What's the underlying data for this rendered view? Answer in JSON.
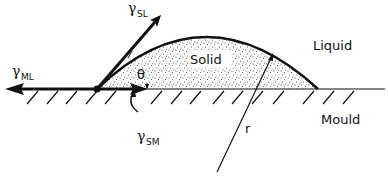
{
  "figure": {
    "type": "contact-angle-diagram",
    "labels": {
      "solid": "Solid",
      "liquid": "Liquid",
      "mould": "Mould",
      "theta": "θ",
      "radius": "r"
    },
    "tensions": {
      "sl": {
        "symbol": "γ",
        "subscript": "SL",
        "direction": "up-right along tangent"
      },
      "ml": {
        "symbol": "γ",
        "subscript": "ML",
        "direction": "left along mould surface"
      },
      "sm": {
        "symbol": "γ",
        "subscript": "SM",
        "direction": "right along mould surface"
      }
    },
    "colors": {
      "ink": "#111111",
      "background": "#ffffff",
      "stipple": "#333333"
    }
  }
}
